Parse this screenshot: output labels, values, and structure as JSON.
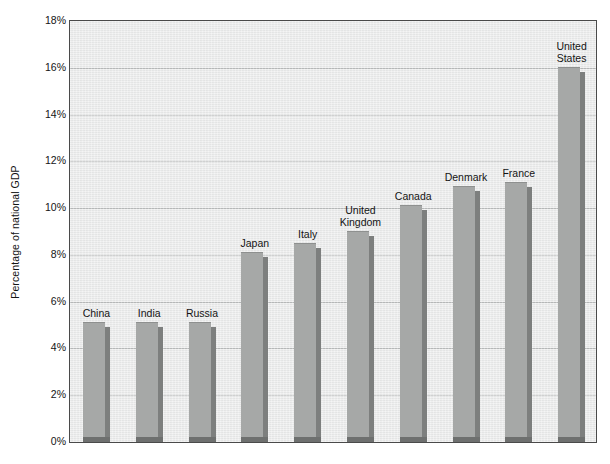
{
  "chart_data": {
    "type": "bar",
    "title": "",
    "subtitle": "",
    "xlabel": "",
    "ylabel": "Percentage of national GDP",
    "ylim": [
      0,
      18
    ],
    "ytick_labels": [
      "0%",
      "2%",
      "4%",
      "6%",
      "8%",
      "10%",
      "12%",
      "14%",
      "16%",
      "18%"
    ],
    "ytick_values": [
      0,
      2,
      4,
      6,
      8,
      10,
      12,
      14,
      16,
      18
    ],
    "grid": true,
    "legend": "none",
    "value_unit": "%",
    "categories": [
      "China",
      "India",
      "Russia",
      "Japan",
      "Italy",
      "United Kingdom",
      "Canada",
      "Denmark",
      "France",
      "United States"
    ],
    "values": [
      5.0,
      5.0,
      5.0,
      8.0,
      8.4,
      8.9,
      10.0,
      10.8,
      11.0,
      15.9
    ],
    "bar_color": "#a6a8a7",
    "bar_shadow_color": "#7d7f7e",
    "plot_background": "#e9eaea",
    "gridline_color": "#b9bbbb",
    "axis_color": "#4a4a4a"
  },
  "labels": {
    "category_label_lines": [
      [
        "China"
      ],
      [
        "India"
      ],
      [
        "Russia"
      ],
      [
        "Japan"
      ],
      [
        "Italy"
      ],
      [
        "United",
        "Kingdom"
      ],
      [
        "Canada"
      ],
      [
        "Denmark"
      ],
      [
        "France"
      ],
      [
        "United",
        "States"
      ]
    ]
  }
}
